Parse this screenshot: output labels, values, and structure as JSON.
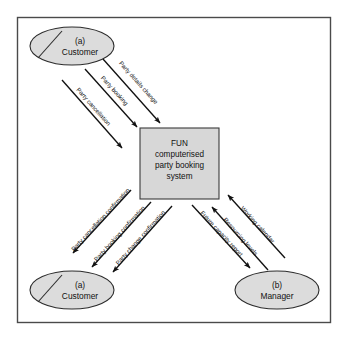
{
  "diagram": {
    "colors": {
      "frame_border": "#4a4a4a",
      "entity_fill": "#dcdcdc",
      "entity_border": "#2b2b2b",
      "process_fill": "#d7d7d7",
      "process_border": "#3a3a3a",
      "flow_stroke": "#111111",
      "background": "#ffffff"
    },
    "process": {
      "id": "fun-system",
      "lines": [
        "FUN",
        "computerised",
        "party booking",
        "system"
      ]
    },
    "entities": [
      {
        "id": "customer-top",
        "tag": "(a)",
        "label": "Customer",
        "has_slash": true
      },
      {
        "id": "customer-bottom",
        "tag": "(a)",
        "label": "Customer",
        "has_slash": true
      },
      {
        "id": "manager",
        "tag": "(b)",
        "label": "Manager",
        "has_slash": false
      }
    ],
    "flows": [
      {
        "id": "flow-party-details-change",
        "label": "Party details change",
        "from": "customer-top",
        "to": "fun-system"
      },
      {
        "id": "flow-party-booking",
        "label": "Party booking",
        "from": "customer-top",
        "to": "fun-system"
      },
      {
        "id": "flow-party-cancellation",
        "label": "Party cancellation",
        "from": "customer-top",
        "to": "fun-system"
      },
      {
        "id": "flow-party-cancellation-confirmation",
        "label": "Party cancellation confirmation",
        "from": "fun-system",
        "to": "customer-bottom"
      },
      {
        "id": "flow-party-booking-confirmation",
        "label": "Party booking confirmation",
        "from": "fun-system",
        "to": "customer-bottom"
      },
      {
        "id": "flow-party-change-confirmation",
        "label": "Party change confirmation",
        "from": "fun-system",
        "to": "customer-bottom"
      },
      {
        "id": "flow-working-calendar",
        "label": "Working calendar",
        "from": "manager",
        "to": "fun-system"
      },
      {
        "id": "flow-resourcing-levels",
        "label": "Resourcing levels",
        "from": "manager",
        "to": "fun-system"
      },
      {
        "id": "flow-future-capacity-report",
        "label": "Future capacity report",
        "from": "fun-system",
        "to": "manager"
      }
    ]
  }
}
